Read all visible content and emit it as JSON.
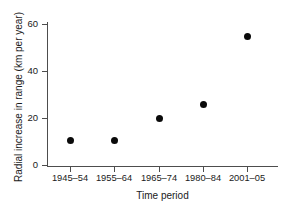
{
  "chart_data": {
    "type": "scatter",
    "title": "",
    "xlabel": "Time period",
    "ylabel": "Radial increase in range (km per year)",
    "categories": [
      "1945–54",
      "1955–64",
      "1965–74",
      "1980–84",
      "2001–05"
    ],
    "values": [
      10.5,
      10.5,
      19.8,
      26.0,
      54.5
    ],
    "ylim": [
      0,
      62
    ],
    "yticks": [
      "0",
      "20",
      "40",
      "60"
    ],
    "ytick_values": [
      0,
      20,
      40,
      60
    ],
    "grid": false,
    "legend": false,
    "marker": "filled-circle",
    "marker_color": "#0a0a0a",
    "axis_color": "#4d4d4d"
  }
}
